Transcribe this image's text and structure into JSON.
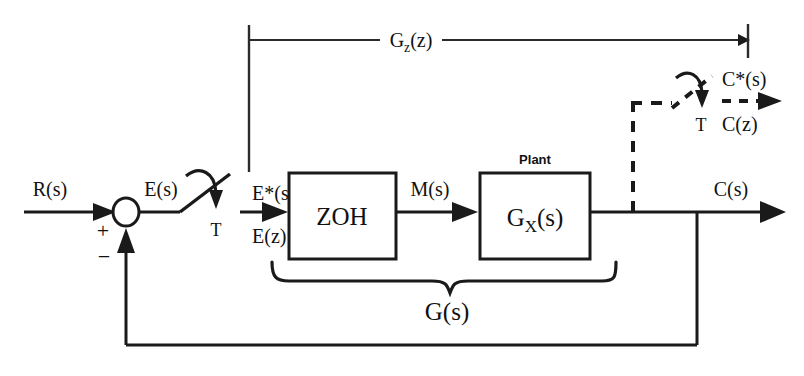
{
  "diagram": {
    "background_color": "#ffffff",
    "line_color": "#1a1a1a",
    "signals": {
      "reference_input": "R(s)",
      "error": "E(s)",
      "sampled_error_s": "E*(s)",
      "sampled_error_z": "E(z)",
      "control_effort": "M(s)",
      "output": "C(s)",
      "sampled_output_s": "C*(s)",
      "sampled_output_z": "C(z)"
    },
    "blocks": [
      {
        "id": "zoh",
        "label": "ZOH",
        "caption": ""
      },
      {
        "id": "plant",
        "label": "G<sub>X</sub>(s)",
        "label_main": "G",
        "label_sub": "X",
        "label_tail": "(s)",
        "caption": "Plant"
      }
    ],
    "summing_junction": {
      "name": "summing-junction",
      "positive_sign": "+",
      "negative_sign": "−"
    },
    "samplers": [
      {
        "id": "input-sampler",
        "period_label": "T"
      },
      {
        "id": "output-sampler",
        "period_label": "T"
      }
    ],
    "spans": [
      {
        "id": "gz-span",
        "label_main": "G",
        "label_sub": "z",
        "label_tail": "(z)",
        "label_full": "G z (z)"
      }
    ],
    "braces": [
      {
        "id": "gs-brace",
        "label": "G(s)"
      }
    ]
  }
}
